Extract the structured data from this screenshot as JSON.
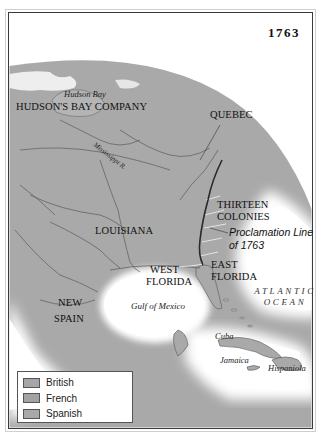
{
  "map": {
    "year": "1763",
    "regions": {
      "hudson_bay": "Hudson Bay",
      "hudsons_bay_company": "HUDSON'S BAY COMPANY",
      "quebec": "QUEBEC",
      "mississippi": "Mississippi R.",
      "thirteen_colonies_1": "THIRTEEN",
      "thirteen_colonies_2": "COLONIES",
      "proclamation_1": "Proclamation Line",
      "proclamation_2": "of 1763",
      "louisiana": "LOUISIANA",
      "west_florida_1": "WEST",
      "west_florida_2": "FLORIDA",
      "east_florida_1": "EAST",
      "east_florida_2": "FLORIDA",
      "atlantic_1": "ATLANTIC",
      "atlantic_2": "OCEAN",
      "gulf": "Gulf of Mexico",
      "new_spain_1": "NEW",
      "new_spain_2": "SPAIN",
      "cuba": "Cuba",
      "jamaica": "Jamaica",
      "hispaniola": "Hispaniola"
    },
    "colors": {
      "land": "#a9a9a9",
      "british": "#a6a6a6",
      "french": "#a2a2a2",
      "spanish": "#a9a9a9",
      "water": "#ffffff",
      "border": "#5a5a5a"
    }
  },
  "legend": {
    "items": [
      {
        "label": "British",
        "color": "#a6a6a6"
      },
      {
        "label": "French",
        "color": "#a2a2a2"
      },
      {
        "label": "Spanish",
        "color": "#a9a9a9"
      }
    ]
  }
}
